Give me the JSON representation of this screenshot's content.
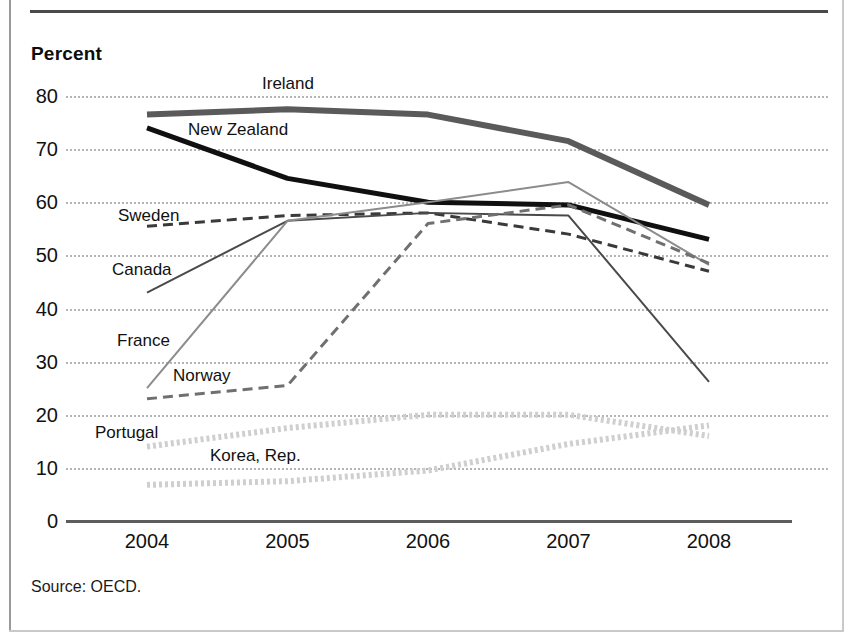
{
  "figure": {
    "y_axis_title": "Percent",
    "source": "Source: OECD."
  },
  "chart_data": {
    "type": "line",
    "title": "",
    "subtitle": "",
    "xlabel": "",
    "ylabel": "Percent",
    "x": [
      "2004",
      "2005",
      "2006",
      "2007",
      "2008"
    ],
    "categories": [
      "2004",
      "2005",
      "2006",
      "2007",
      "2008"
    ],
    "ylim": [
      0,
      80
    ],
    "yticks": [
      0,
      10,
      20,
      30,
      40,
      50,
      60,
      70,
      80
    ],
    "grid": true,
    "legend_position": "inline-labels",
    "annotations": [
      "Ireland",
      "New Zealand",
      "Sweden",
      "Canada",
      "France",
      "Norway",
      "Portugal",
      "Korea, Rep."
    ],
    "series": [
      {
        "name": "Ireland",
        "values": [
          76.5,
          77.5,
          76.5,
          71.5,
          59.5
        ],
        "color": "#5a5a5a",
        "style": "solid-thick",
        "width": 6,
        "dash": "none"
      },
      {
        "name": "New Zealand",
        "values": [
          74.0,
          64.5,
          60.0,
          59.5,
          53.0
        ],
        "color": "#101010",
        "style": "solid-thick",
        "width": 5,
        "dash": "none"
      },
      {
        "name": "Sweden",
        "values": [
          55.5,
          57.5,
          58.0,
          54.0,
          47.0
        ],
        "color": "#3a3a3a",
        "style": "dashed",
        "width": 3,
        "dash": "10 6"
      },
      {
        "name": "Canada",
        "values": [
          43.0,
          56.5,
          58.0,
          57.5,
          26.2
        ],
        "color": "#4a4a4a",
        "style": "solid-thin",
        "width": 2,
        "dash": "none"
      },
      {
        "name": "France",
        "values": [
          25.0,
          56.5,
          60.0,
          63.8,
          48.2
        ],
        "color": "#8c8c8c",
        "style": "solid-thin",
        "width": 2,
        "dash": "none"
      },
      {
        "name": "Norway",
        "values": [
          23.0,
          25.5,
          56.0,
          59.5,
          48.5
        ],
        "color": "#707070",
        "style": "dashed",
        "width": 3,
        "dash": "10 6"
      },
      {
        "name": "Portugal",
        "values": [
          14.0,
          17.5,
          20.0,
          20.0,
          16.0
        ],
        "color": "#cfcfcf",
        "style": "dotted-thick",
        "width": 6,
        "dash": "3 3"
      },
      {
        "name": "Korea, Rep.",
        "values": [
          6.8,
          7.5,
          9.5,
          14.5,
          18.0
        ],
        "color": "#cfcfcf",
        "style": "dotted-thick",
        "width": 6,
        "dash": "3 3"
      }
    ],
    "series_labels": [
      {
        "name": "Ireland",
        "text": "Ireland",
        "x": 262,
        "y": 74
      },
      {
        "name": "New Zealand",
        "text": "New Zealand",
        "x": 188,
        "y": 120
      },
      {
        "name": "Sweden",
        "text": "Sweden",
        "x": 118,
        "y": 206
      },
      {
        "name": "Canada",
        "text": "Canada",
        "x": 112,
        "y": 260
      },
      {
        "name": "France",
        "text": "France",
        "x": 117,
        "y": 331
      },
      {
        "name": "Norway",
        "text": "Norway",
        "x": 173,
        "y": 366
      },
      {
        "name": "Portugal",
        "text": "Portugal",
        "x": 95,
        "y": 423
      },
      {
        "name": "Korea, Rep.",
        "text": "Korea, Rep.",
        "x": 210,
        "y": 446
      }
    ]
  }
}
